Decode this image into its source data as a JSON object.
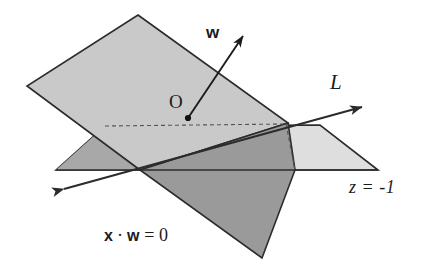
{
  "figure": {
    "background": "#ffffff",
    "stroke_color": "#2b2b2b",
    "dash_color": "#555555",
    "colors": {
      "tilted_plane_upper_fill": "#c9c9c9",
      "horizontal_plane_fill": "#dedede",
      "dark_wedge_left_fill": "#a8a8a8",
      "dark_wedge_lower_fill": "#9a9a9a",
      "outline": "#2b2b2b"
    }
  },
  "labels": {
    "normal_vector": "w",
    "origin_point": "O",
    "intersection_line": "L",
    "horizontal_plane": "z = -1",
    "hyperplane_x": "x",
    "hyperplane_dot": "·",
    "hyperplane_w": "w",
    "hyperplane_eq": "= 0"
  },
  "geometry": {
    "tilted_plane_vertices": "(138,15) (288,123) (140,170) (27,86)",
    "horizontal_plane_vertices": "(56,170) (105,126) (320,125) (378,170)",
    "dashed_top_edge": "(105,126) to (286,124)",
    "dashed_right_edge": "(286,124) to (295,170)",
    "line_L_start": "(53,193)",
    "line_L_end": "(372,104)",
    "vector_w_start": "(188,118)",
    "vector_w_end": "(247,31)",
    "origin_dot": "(188,118)"
  }
}
